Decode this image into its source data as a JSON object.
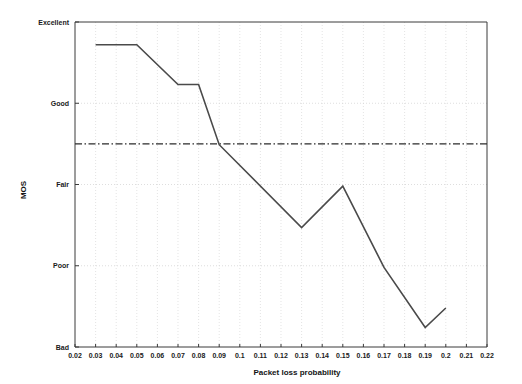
{
  "chart_data": {
    "type": "line",
    "title": "",
    "subtitle": "",
    "xlabel": "Packet loss probability",
    "ylabel": "MOS",
    "xlim": [
      0.02,
      0.22
    ],
    "ylim": [
      1,
      5
    ],
    "grid": true,
    "legend_position": "none",
    "x_ticks": [
      "0.02",
      "0.03",
      "0.04",
      "0.05",
      "0.06",
      "0.07",
      "0.08",
      "0.09",
      "0.1",
      "0.11",
      "0.12",
      "0.13",
      "0.14",
      "0.15",
      "0.16",
      "0.17",
      "0.18",
      "0.19",
      "0.2",
      "0.21",
      "0.22"
    ],
    "x_tick_values": [
      0.02,
      0.03,
      0.04,
      0.05,
      0.06,
      0.07,
      0.08,
      0.09,
      0.1,
      0.11,
      0.12,
      0.13,
      0.14,
      0.15,
      0.16,
      0.17,
      0.18,
      0.19,
      0.2,
      0.21,
      0.22
    ],
    "y_ticks": [
      "Excellent",
      "Good",
      "Fair",
      "Poor",
      "Bad"
    ],
    "y_tick_values": [
      5,
      4,
      3,
      2,
      1
    ],
    "series": [
      {
        "name": "MOS",
        "color": "#4a4a4a",
        "x": [
          0.03,
          0.05,
          0.07,
          0.08,
          0.09,
          0.13,
          0.15,
          0.17,
          0.19,
          0.2
        ],
        "values": [
          4.72,
          4.72,
          4.23,
          4.23,
          3.49,
          2.47,
          2.98,
          1.98,
          1.24,
          1.48
        ]
      }
    ],
    "annotations": [
      {
        "name": "acceptability-threshold",
        "type": "horizontal-line",
        "style": "dash-dot",
        "value": 3.5,
        "color": "#2b2b2b"
      }
    ]
  }
}
